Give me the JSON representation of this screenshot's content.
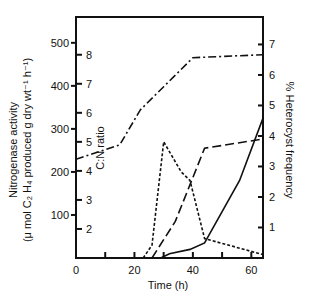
{
  "chart_data": {
    "type": "line",
    "title": "",
    "xlabel": "Time (h)",
    "ylabel_left": "Nitrogenase activity (μ mol C2H4 produced g dry wt⁻¹ h⁻¹)",
    "ylabel_inner": "C:N ratio",
    "ylabel_right": "% Heterocyst frequency",
    "x_ticks": [
      0,
      20,
      40,
      60
    ],
    "x_minor_ticks": [
      10,
      30,
      50
    ],
    "xlim": [
      0,
      64
    ],
    "y_left_ticks": [
      100,
      200,
      300,
      400,
      500
    ],
    "y_left_lim": [
      0,
      560
    ],
    "y_inner_ticks": [
      2,
      3,
      4,
      5,
      6,
      7,
      8
    ],
    "y_inner_lim": [
      1,
      9.3
    ],
    "y_right_ticks": [
      1,
      2,
      3,
      4,
      5,
      6,
      7
    ],
    "y_right_lim": [
      0,
      7.9
    ],
    "grid": false,
    "legend": "none",
    "series": [
      {
        "name": "C:N ratio",
        "style": "dash-dot",
        "axis": "inner",
        "x": [
          0,
          15,
          22,
          30,
          40,
          64
        ],
        "values": [
          4.4,
          4.9,
          6.1,
          6.9,
          7.9,
          8.0
        ]
      },
      {
        "name": "short-dash series",
        "style": "short-dash",
        "axis": "left",
        "x": [
          23,
          26,
          30,
          36,
          39,
          44,
          64
        ],
        "values": [
          0,
          30,
          270,
          200,
          180,
          45,
          8
        ]
      },
      {
        "name": "long-dash series",
        "style": "long-dash",
        "axis": "right",
        "x": [
          26,
          34,
          44,
          64
        ],
        "values": [
          0,
          1.2,
          3.6,
          3.9
        ]
      },
      {
        "name": "solid series",
        "style": "solid",
        "axis": "left",
        "x": [
          29,
          32,
          39,
          44,
          56,
          64
        ],
        "values": [
          0,
          10,
          20,
          35,
          180,
          325
        ]
      }
    ]
  }
}
